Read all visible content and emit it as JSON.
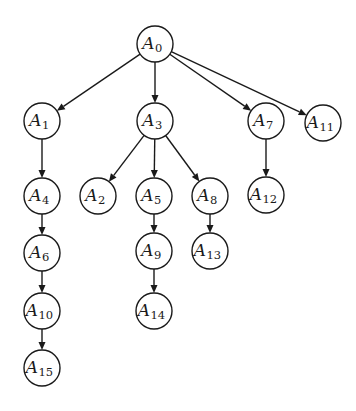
{
  "diagram": {
    "type": "tree",
    "root": "A0",
    "nodes": [
      {
        "id": "A0",
        "letter": "A",
        "sub": "0",
        "x": 155,
        "y": 44
      },
      {
        "id": "A1",
        "letter": "A",
        "sub": "1",
        "x": 42,
        "y": 121
      },
      {
        "id": "A3",
        "letter": "A",
        "sub": "3",
        "x": 155,
        "y": 121
      },
      {
        "id": "A7",
        "letter": "A",
        "sub": "7",
        "x": 266,
        "y": 121
      },
      {
        "id": "A11",
        "letter": "A",
        "sub": "11",
        "x": 323,
        "y": 123
      },
      {
        "id": "A4",
        "letter": "A",
        "sub": "4",
        "x": 42,
        "y": 196
      },
      {
        "id": "A2",
        "letter": "A",
        "sub": "2",
        "x": 98,
        "y": 196
      },
      {
        "id": "A5",
        "letter": "A",
        "sub": "5",
        "x": 154,
        "y": 196
      },
      {
        "id": "A8",
        "letter": "A",
        "sub": "8",
        "x": 210,
        "y": 196
      },
      {
        "id": "A12",
        "letter": "A",
        "sub": "12",
        "x": 266,
        "y": 195
      },
      {
        "id": "A6",
        "letter": "A",
        "sub": "6",
        "x": 42,
        "y": 253
      },
      {
        "id": "A9",
        "letter": "A",
        "sub": "9",
        "x": 154,
        "y": 251
      },
      {
        "id": "A13",
        "letter": "A",
        "sub": "13",
        "x": 210,
        "y": 251
      },
      {
        "id": "A10",
        "letter": "A",
        "sub": "10",
        "x": 42,
        "y": 311
      },
      {
        "id": "A14",
        "letter": "A",
        "sub": "14",
        "x": 154,
        "y": 311
      },
      {
        "id": "A15",
        "letter": "A",
        "sub": "15",
        "x": 42,
        "y": 368
      }
    ],
    "edges": [
      {
        "from": "A0",
        "to": "A1"
      },
      {
        "from": "A0",
        "to": "A3"
      },
      {
        "from": "A0",
        "to": "A7"
      },
      {
        "from": "A0",
        "to": "A11"
      },
      {
        "from": "A1",
        "to": "A4"
      },
      {
        "from": "A3",
        "to": "A2"
      },
      {
        "from": "A3",
        "to": "A5"
      },
      {
        "from": "A3",
        "to": "A8"
      },
      {
        "from": "A7",
        "to": "A12"
      },
      {
        "from": "A4",
        "to": "A6"
      },
      {
        "from": "A5",
        "to": "A9"
      },
      {
        "from": "A8",
        "to": "A13"
      },
      {
        "from": "A6",
        "to": "A10"
      },
      {
        "from": "A9",
        "to": "A14"
      },
      {
        "from": "A10",
        "to": "A15"
      }
    ],
    "node_radius": 18,
    "colors": {
      "stroke": "#1a1a1a",
      "fill": "#ffffff",
      "background": "#ffffff"
    }
  }
}
